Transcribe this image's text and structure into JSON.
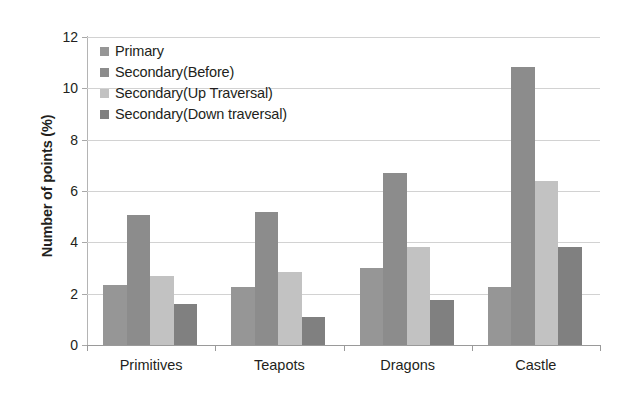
{
  "chart_data": {
    "type": "bar",
    "title": "",
    "xlabel": "",
    "ylabel": "Number of points (%)",
    "categories": [
      "Primitives",
      "Teapots",
      "Dragons",
      "Castle"
    ],
    "series": [
      {
        "name": "Primary",
        "color": "#969696",
        "values": [
          2.35,
          2.25,
          3.0,
          2.25
        ]
      },
      {
        "name": "Secondary(Before)",
        "color": "#8c8c8c",
        "values": [
          5.05,
          5.2,
          6.7,
          10.85
        ]
      },
      {
        "name": "Secondary(Up Traversal)",
        "color": "#c2c2c2",
        "values": [
          2.7,
          2.85,
          3.8,
          6.4
        ]
      },
      {
        "name": "Secondary(Down traversal)",
        "color": "#808080",
        "values": [
          1.6,
          1.1,
          1.75,
          3.8
        ]
      }
    ],
    "ylim": [
      0,
      12
    ],
    "yticks": [
      0,
      2,
      4,
      6,
      8,
      10,
      12
    ],
    "ytick_labels": [
      "0",
      "2",
      "4",
      "6",
      "8",
      "10",
      "12"
    ],
    "grid": true,
    "grid_axis": "y",
    "legend_position": "upper left",
    "background_color": "#ffffff",
    "gridline_color": "#d2d2d2",
    "axis_color": "#9a9a9a",
    "text_color": "#231f20"
  }
}
